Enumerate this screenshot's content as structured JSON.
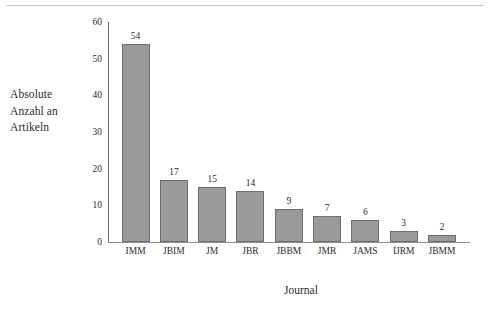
{
  "chart_data": {
    "type": "bar",
    "title": "",
    "subtitle": "",
    "xlabel": "Journal",
    "ylabel": "Absolute Anzahl an Artikeln",
    "ylabel_lines": [
      "Absolute",
      "Anzahl an",
      "Artikeln"
    ],
    "categories": [
      "IMM",
      "JBIM",
      "JM",
      "JBR",
      "JBBM",
      "JMR",
      "JAMS",
      "IJRM",
      "JBMM"
    ],
    "values": [
      54,
      17,
      15,
      14,
      9,
      7,
      6,
      3,
      2
    ],
    "data_labels": [
      "54",
      "17",
      "15",
      "14",
      "9",
      "7",
      "6",
      "3",
      "2"
    ],
    "ylim": [
      0,
      60
    ],
    "yticks": [
      0,
      10,
      20,
      30,
      40,
      50,
      60
    ],
    "ytick_labels": [
      "0",
      "10",
      "20",
      "30",
      "40",
      "50",
      "60"
    ],
    "grid": false,
    "legend": false,
    "legend_position": "none",
    "bar_fill_color": "#9a9a9a",
    "bar_border_color": "#6e6e6e",
    "axis_color": "#6a6a6a",
    "text_color": "#2b2b2b",
    "background_color": "#ffffff",
    "show_data_labels": true,
    "orientation": "vertical"
  }
}
